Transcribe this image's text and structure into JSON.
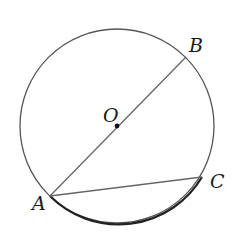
{
  "diagram": {
    "type": "circle-geometry",
    "circle": {
      "center_label": "O",
      "cx": 117,
      "cy": 126,
      "r": 97,
      "stroke": "#555555"
    },
    "points": [
      {
        "name": "A",
        "x": 50,
        "y": 196,
        "label": "A",
        "label_x": 32,
        "label_y": 210
      },
      {
        "name": "B",
        "x": 186,
        "y": 57,
        "label": "B",
        "label_x": 189,
        "label_y": 52
      },
      {
        "name": "C",
        "x": 202,
        "y": 177,
        "label": "C",
        "label_x": 210,
        "label_y": 188
      },
      {
        "name": "O",
        "x": 117,
        "y": 126,
        "label": "O",
        "label_x": 103,
        "label_y": 122
      }
    ],
    "segments": [
      {
        "from": "A",
        "to": "B",
        "description": "diameter AB through center O"
      },
      {
        "from": "A",
        "to": "C",
        "description": "chord AC"
      }
    ],
    "highlighted_arc": {
      "from": "A",
      "to": "C",
      "description": "minor arc AC drawn bold",
      "stroke": "#222222"
    }
  }
}
